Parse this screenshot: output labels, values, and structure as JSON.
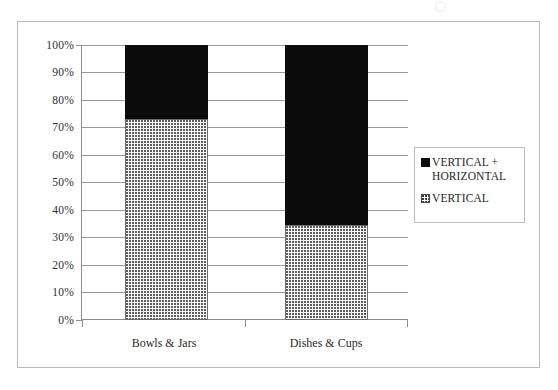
{
  "figure": {
    "scan_artifact": "scan-speck"
  },
  "legend": {
    "position": "right",
    "entries": [
      {
        "label": "VERTICAL +\nHORIZONTAL",
        "swatch": "black-square-icon",
        "color": "#0b0b0b"
      },
      {
        "label": "VERTICAL",
        "swatch": "dotted-square-icon",
        "color": "#fdfdfd"
      }
    ]
  },
  "axes": {
    "y_ticks": [
      "100%",
      "90%",
      "80%",
      "70%",
      "60%",
      "50%",
      "40%",
      "30%",
      "20%",
      "10%",
      "0%"
    ],
    "x_ticks": [
      "Bowls & Jars",
      "Dishes & Cups"
    ]
  },
  "chart_data": {
    "type": "bar",
    "stacked": true,
    "normalized_percent": true,
    "title": "",
    "subtitle": "",
    "xlabel": "",
    "ylabel": "",
    "ylim": [
      0,
      100
    ],
    "yticks": [
      0,
      10,
      20,
      30,
      40,
      50,
      60,
      70,
      80,
      90,
      100
    ],
    "ytick_labels": [
      "0%",
      "10%",
      "20%",
      "30%",
      "40%",
      "50%",
      "60%",
      "70%",
      "80%",
      "90%",
      "100%"
    ],
    "grid": true,
    "grid_axis": "y",
    "legend_position": "right",
    "categories": [
      "Bowls & Jars",
      "Dishes & Cups"
    ],
    "series": [
      {
        "name": "VERTICAL",
        "values": [
          73,
          34.5
        ],
        "color": "#fdfdfd",
        "pattern": "dotted",
        "edge_color": "#6b6b6b"
      },
      {
        "name": "VERTICAL + HORIZONTAL",
        "values": [
          27,
          65.5
        ],
        "color": "#0b0b0b",
        "pattern": "solid",
        "edge_color": "#0b0b0b"
      }
    ],
    "stack_order_bottom_to_top": [
      "VERTICAL",
      "VERTICAL + HORIZONTAL"
    ]
  }
}
